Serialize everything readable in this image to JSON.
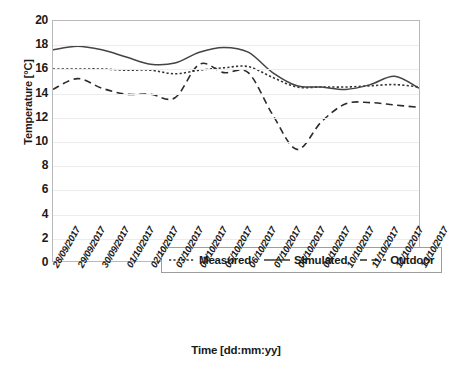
{
  "chart_data": {
    "type": "line",
    "title": "",
    "xlabel": "Time [dd:mm:yy]",
    "ylabel": "Temperature [°C]",
    "ylim": [
      0,
      20
    ],
    "ytick_step": 2,
    "yticks": [
      "20",
      "18",
      "16",
      "14",
      "12",
      "10",
      "8",
      "6",
      "4",
      "2",
      "0"
    ],
    "grid": true,
    "legend_position": "inside-bottom-center",
    "categories": [
      "28/09/2017",
      "29/09/2017",
      "30/09/2017",
      "01/10/2017",
      "02/10/2017",
      "03/10/2017",
      "04/10/2017",
      "05/10/2017",
      "06/10/2017",
      "07/10/2017",
      "08/10/2017",
      "09/10/2017",
      "10/10/2017",
      "11/10/2017",
      "12/10/2017",
      "13/10/2017"
    ],
    "series": [
      {
        "name": "Measured",
        "style": "dotted",
        "color": "#333333",
        "values": [
          16.0,
          16.0,
          16.0,
          15.9,
          15.9,
          15.6,
          15.9,
          16.1,
          16.2,
          15.3,
          14.5,
          14.5,
          14.5,
          14.6,
          14.7,
          14.5
        ]
      },
      {
        "name": "Simulated",
        "style": "solid",
        "color": "#444444",
        "values": [
          17.6,
          17.9,
          17.6,
          17.0,
          16.4,
          16.5,
          17.4,
          17.8,
          17.4,
          15.7,
          14.6,
          14.5,
          14.3,
          14.7,
          15.4,
          14.4
        ]
      },
      {
        "name": "Outdoor",
        "style": "dashed",
        "color": "#2b2b2b",
        "values": [
          14.3,
          15.2,
          14.4,
          13.9,
          13.9,
          13.6,
          16.4,
          15.7,
          15.7,
          12.2,
          9.3,
          11.6,
          13.1,
          13.2,
          13.0,
          12.8
        ]
      }
    ]
  },
  "legend": {
    "items": [
      {
        "label": "Measured",
        "swatch": "dotted-line-swatch"
      },
      {
        "label": "Simulated",
        "swatch": "solid-line-swatch"
      },
      {
        "label": "Outdoor",
        "swatch": "dashed-line-swatch"
      }
    ]
  },
  "colors": {
    "plot_border": "#b9b9b9",
    "gridline": "#ececed",
    "legend_border": "#9d9d9d",
    "text": "#1a1a1a",
    "background": "#ffffff"
  }
}
